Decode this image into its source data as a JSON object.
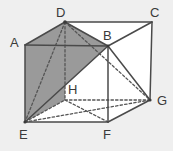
{
  "figure": {
    "type": "geometry-diagram",
    "background_color": "#efefef",
    "shade_color": "#9a9a9a",
    "shade_color_dark": "#8e8e8e",
    "line_color": "#4a4a4a",
    "hidden_line_color": "#5a5a5a",
    "label_color": "#3a3a3a",
    "canvas": {
      "width": 173,
      "height": 151
    }
  },
  "vertices": [
    {
      "id": "A",
      "label": "A",
      "x": 25,
      "y": 45,
      "label_x": 10,
      "label_y": 37,
      "hidden": false
    },
    {
      "id": "B",
      "label": "B",
      "x": 108,
      "y": 46,
      "label_x": 104,
      "label_y": 28,
      "hidden": false
    },
    {
      "id": "C",
      "label": "C",
      "x": 152,
      "y": 22,
      "label_x": 152,
      "label_y": 6,
      "hidden": false
    },
    {
      "id": "D",
      "label": "D",
      "x": 65,
      "y": 22,
      "label_x": 57,
      "label_y": 6,
      "hidden": false
    },
    {
      "id": "E",
      "label": "E",
      "x": 25,
      "y": 122,
      "label_x": 20,
      "label_y": 129,
      "hidden": false
    },
    {
      "id": "F",
      "label": "F",
      "x": 108,
      "y": 122,
      "label_x": 104,
      "label_y": 129,
      "hidden": false
    },
    {
      "id": "G",
      "label": "G",
      "x": 150,
      "y": 100,
      "label_x": 157,
      "label_y": 96,
      "hidden": false
    },
    {
      "id": "H",
      "label": "H",
      "x": 65,
      "y": 100,
      "label_x": 68,
      "label_y": 82,
      "hidden": true
    }
  ],
  "faces": [
    {
      "name": "face-ADE-shaded",
      "points": "25,45 65,22 65,100 25,122",
      "fill": "#9a9a9a"
    },
    {
      "name": "face-ADBE-shaded",
      "points": "25,45 65,22 108,46 25,122",
      "fill": "#949494"
    },
    {
      "name": "face-top-DCB",
      "points": "65,22 152,22 108,46",
      "fill": "#ffffff"
    },
    {
      "name": "face-right-BCGF",
      "points": "108,46 152,22 150,100 108,122",
      "fill": "#ffffff"
    },
    {
      "name": "face-front-lower",
      "points": "25,122 108,122 108,46",
      "fill": "#ffffff"
    }
  ],
  "edges_solid": [
    {
      "name": "edge-A-D",
      "from": "A",
      "to": "D"
    },
    {
      "name": "edge-D-C",
      "from": "D",
      "to": "C"
    },
    {
      "name": "edge-C-B",
      "from": "C",
      "to": "B"
    },
    {
      "name": "edge-A-B",
      "from": "A",
      "to": "B"
    },
    {
      "name": "edge-A-E",
      "from": "A",
      "to": "E"
    },
    {
      "name": "edge-B-F",
      "from": "B",
      "to": "F"
    },
    {
      "name": "edge-C-G",
      "from": "C",
      "to": "G"
    },
    {
      "name": "edge-E-F",
      "from": "E",
      "to": "F"
    },
    {
      "name": "edge-F-G",
      "from": "F",
      "to": "G"
    },
    {
      "name": "edge-D-B",
      "from": "D",
      "to": "B"
    },
    {
      "name": "edge-B-E",
      "from": "B",
      "to": "E"
    },
    {
      "name": "edge-B-G",
      "from": "B",
      "to": "G"
    },
    {
      "name": "edge-E-G",
      "from": "E",
      "to": "G"
    }
  ],
  "edges_dashed": [
    {
      "name": "edge-D-H",
      "from": "D",
      "to": "H"
    },
    {
      "name": "edge-E-H",
      "from": "E",
      "to": "H"
    },
    {
      "name": "edge-H-F",
      "from": "H",
      "to": "F"
    },
    {
      "name": "edge-H-G",
      "from": "H",
      "to": "G"
    },
    {
      "name": "edge-D-E",
      "from": "D",
      "to": "E"
    },
    {
      "name": "edge-D-G",
      "from": "D",
      "to": "G"
    },
    {
      "name": "edge-E-G-dashed",
      "from": "E",
      "to": "G"
    }
  ]
}
